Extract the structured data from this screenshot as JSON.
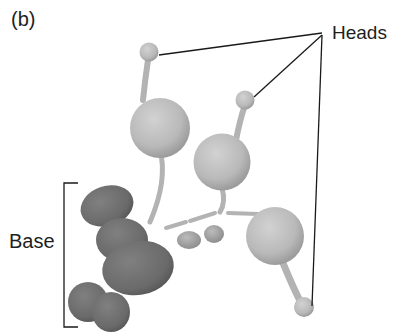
{
  "figure": {
    "panel_label": "(b)",
    "labels": {
      "heads": "Heads",
      "base": "Base"
    },
    "colors": {
      "head_sphere": "#bdbdbd",
      "base_lobe": "#6e6e6e",
      "leader_line": "#1a1a1a",
      "background": "#ffffff"
    },
    "components": {
      "head_count": 3,
      "base_lobes": 5,
      "linker_beads": 2
    }
  }
}
